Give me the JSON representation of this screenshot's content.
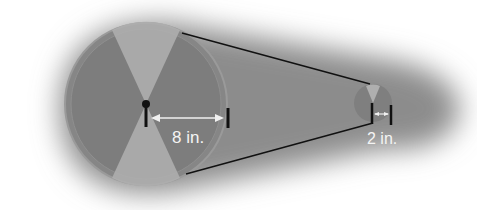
{
  "diagram": {
    "large_pulley": {
      "radius_label": "8 in.",
      "cx": 146,
      "cy": 104,
      "r": 80
    },
    "small_pulley": {
      "radius_label": "2 in.",
      "cx": 373,
      "cy": 103,
      "r": 19
    },
    "colors": {
      "background_glow": "#8a8a8a",
      "pulley_dark": "#7a7a7a",
      "pulley_light": "#b5b5b5",
      "belt": "#111111",
      "label": "#f4f4f4"
    }
  }
}
